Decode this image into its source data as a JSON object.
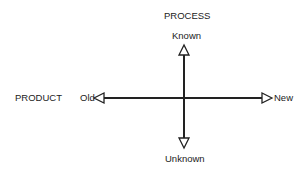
{
  "diagram": {
    "vertical_axis": {
      "title": "PROCESS",
      "top_label": "Known",
      "bottom_label": "Unknown"
    },
    "horizontal_axis": {
      "title": "PRODUCT",
      "left_label": "Old",
      "right_label": "New"
    },
    "colors": {
      "line": "#222222",
      "background": "#ffffff"
    }
  }
}
